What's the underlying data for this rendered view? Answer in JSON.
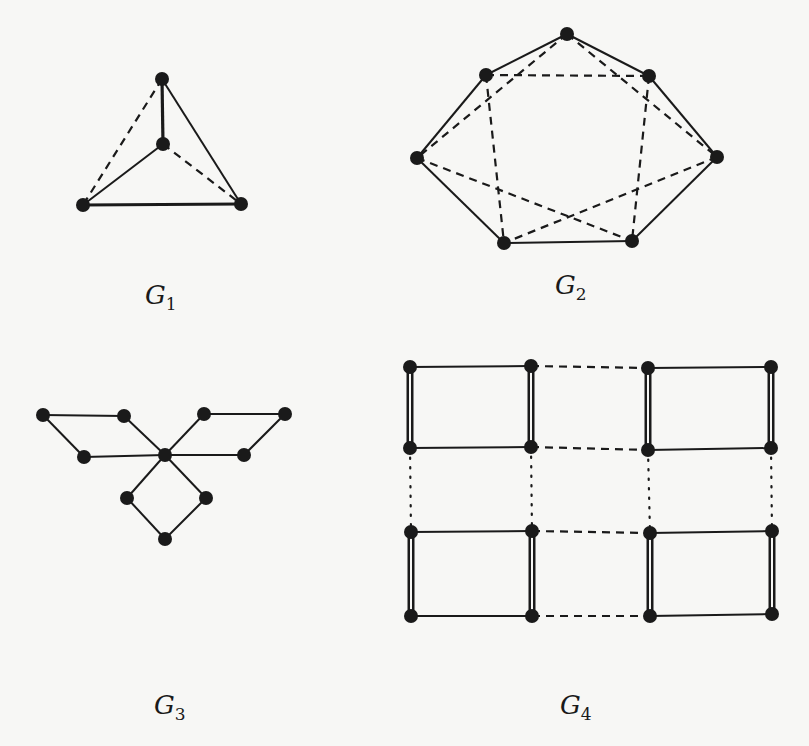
{
  "figure": {
    "graphs": [
      {
        "id": "G1",
        "label_main": "G",
        "label_sub": "1",
        "label_pos": [
          145,
          280
        ],
        "nodes": [
          [
            162,
            79
          ],
          [
            163,
            144
          ],
          [
            83,
            205
          ],
          [
            241,
            204
          ]
        ],
        "edges": [
          {
            "a": 0,
            "b": 1,
            "style": "thick"
          },
          {
            "a": 0,
            "b": 3,
            "style": "solid"
          },
          {
            "a": 1,
            "b": 2,
            "style": "solid"
          },
          {
            "a": 2,
            "b": 3,
            "style": "thick"
          },
          {
            "a": 0,
            "b": 2,
            "style": "dashed"
          },
          {
            "a": 1,
            "b": 3,
            "style": "dashed"
          }
        ]
      },
      {
        "id": "G2",
        "label_main": "G",
        "label_sub": "2",
        "label_pos": [
          555,
          270
        ],
        "nodes": [
          [
            567,
            34
          ],
          [
            486,
            75
          ],
          [
            649,
            76
          ],
          [
            417,
            158
          ],
          [
            717,
            157
          ],
          [
            504,
            243
          ],
          [
            632,
            241
          ]
        ],
        "edges": [
          {
            "a": 0,
            "b": 1,
            "style": "solid"
          },
          {
            "a": 0,
            "b": 2,
            "style": "solid"
          },
          {
            "a": 1,
            "b": 3,
            "style": "solid"
          },
          {
            "a": 2,
            "b": 4,
            "style": "solid"
          },
          {
            "a": 3,
            "b": 5,
            "style": "solid"
          },
          {
            "a": 4,
            "b": 6,
            "style": "solid"
          },
          {
            "a": 5,
            "b": 6,
            "style": "solid"
          },
          {
            "a": 1,
            "b": 2,
            "style": "dashed"
          },
          {
            "a": 0,
            "b": 3,
            "style": "dashed"
          },
          {
            "a": 0,
            "b": 4,
            "style": "dashed"
          },
          {
            "a": 1,
            "b": 5,
            "style": "dashed"
          },
          {
            "a": 2,
            "b": 6,
            "style": "dashed"
          },
          {
            "a": 3,
            "b": 6,
            "style": "dashed"
          },
          {
            "a": 4,
            "b": 5,
            "style": "dashed"
          }
        ]
      },
      {
        "id": "G3",
        "label_main": "G",
        "label_sub": "3",
        "label_pos": [
          154,
          690
        ],
        "nodes": [
          [
            165,
            455
          ],
          [
            43,
            415
          ],
          [
            124,
            416
          ],
          [
            84,
            457
          ],
          [
            204,
            414
          ],
          [
            285,
            414
          ],
          [
            244,
            455
          ],
          [
            127,
            498
          ],
          [
            206,
            498
          ],
          [
            165,
            539
          ]
        ],
        "edges": [
          {
            "a": 1,
            "b": 2,
            "style": "solid"
          },
          {
            "a": 1,
            "b": 3,
            "style": "solid"
          },
          {
            "a": 2,
            "b": 0,
            "style": "solid"
          },
          {
            "a": 3,
            "b": 0,
            "style": "solid"
          },
          {
            "a": 4,
            "b": 5,
            "style": "solid"
          },
          {
            "a": 5,
            "b": 6,
            "style": "solid"
          },
          {
            "a": 4,
            "b": 0,
            "style": "solid"
          },
          {
            "a": 6,
            "b": 0,
            "style": "solid"
          },
          {
            "a": 0,
            "b": 7,
            "style": "solid"
          },
          {
            "a": 0,
            "b": 8,
            "style": "solid"
          },
          {
            "a": 7,
            "b": 9,
            "style": "solid"
          },
          {
            "a": 8,
            "b": 9,
            "style": "solid"
          }
        ]
      },
      {
        "id": "G4",
        "label_main": "G",
        "label_sub": "4",
        "label_pos": [
          560,
          690
        ],
        "nodes": [
          [
            410,
            367
          ],
          [
            531,
            366
          ],
          [
            648,
            368
          ],
          [
            771,
            367
          ],
          [
            410,
            448
          ],
          [
            531,
            447
          ],
          [
            648,
            450
          ],
          [
            771,
            448
          ],
          [
            411,
            532
          ],
          [
            532,
            531
          ],
          [
            650,
            533
          ],
          [
            772,
            531
          ],
          [
            411,
            616
          ],
          [
            532,
            616
          ],
          [
            650,
            616
          ],
          [
            772,
            614
          ]
        ],
        "edges": [
          {
            "a": 0,
            "b": 1,
            "style": "solid"
          },
          {
            "a": 2,
            "b": 3,
            "style": "solid"
          },
          {
            "a": 4,
            "b": 5,
            "style": "solid"
          },
          {
            "a": 6,
            "b": 7,
            "style": "solid"
          },
          {
            "a": 8,
            "b": 9,
            "style": "solid"
          },
          {
            "a": 10,
            "b": 11,
            "style": "solid"
          },
          {
            "a": 12,
            "b": 13,
            "style": "solid"
          },
          {
            "a": 14,
            "b": 15,
            "style": "solid"
          },
          {
            "a": 1,
            "b": 2,
            "style": "dashed"
          },
          {
            "a": 5,
            "b": 6,
            "style": "dashed"
          },
          {
            "a": 9,
            "b": 10,
            "style": "dashed"
          },
          {
            "a": 13,
            "b": 14,
            "style": "dashed"
          },
          {
            "a": 0,
            "b": 4,
            "style": "double"
          },
          {
            "a": 1,
            "b": 5,
            "style": "double"
          },
          {
            "a": 2,
            "b": 6,
            "style": "double"
          },
          {
            "a": 3,
            "b": 7,
            "style": "double"
          },
          {
            "a": 8,
            "b": 12,
            "style": "double"
          },
          {
            "a": 9,
            "b": 13,
            "style": "double"
          },
          {
            "a": 10,
            "b": 14,
            "style": "double"
          },
          {
            "a": 11,
            "b": 15,
            "style": "double"
          },
          {
            "a": 4,
            "b": 8,
            "style": "dotted"
          },
          {
            "a": 5,
            "b": 9,
            "style": "dotted"
          },
          {
            "a": 6,
            "b": 10,
            "style": "dotted"
          },
          {
            "a": 7,
            "b": 11,
            "style": "dotted"
          }
        ]
      }
    ],
    "colors": {
      "ink": "#1a1a1a",
      "background": "#f7f7f5"
    },
    "node_radius": 7
  }
}
